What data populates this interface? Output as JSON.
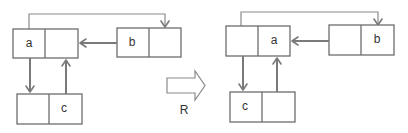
{
  "diagram": {
    "left": {
      "cells": {
        "a": "a",
        "b": "b",
        "c": "c"
      }
    },
    "right": {
      "cells": {
        "a": "a",
        "b": "b",
        "c": "c"
      }
    },
    "transform": {
      "label": "R"
    },
    "colors": {
      "stroke": "#6d6d6d",
      "arrow": "#7a7a7a",
      "background": "#ffffff"
    }
  }
}
